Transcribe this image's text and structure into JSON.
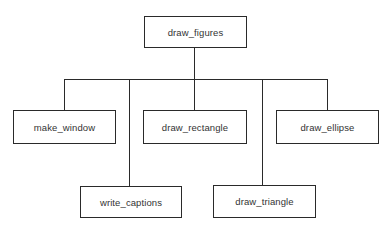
{
  "diagram": {
    "type": "hierarchy-chart",
    "root": {
      "label": "draw_figures"
    },
    "children": [
      {
        "label": "make_window"
      },
      {
        "label": "write_captions"
      },
      {
        "label": "draw_rectangle"
      },
      {
        "label": "draw_triangle"
      },
      {
        "label": "draw_ellipse"
      }
    ]
  },
  "colors": {
    "line": "#2a2a2a",
    "text": "#333333",
    "background": "#ffffff"
  }
}
